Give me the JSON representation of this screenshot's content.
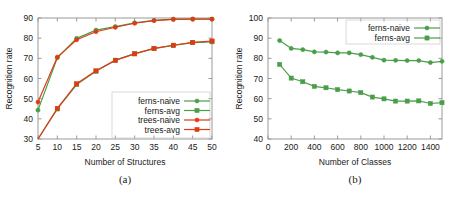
{
  "figure": {
    "panels": [
      {
        "id": "panel-a",
        "subfigure_label": "(a)",
        "xlabel": "Number of Structures",
        "ylabel": "Recognition rate"
      },
      {
        "id": "panel-b",
        "subfigure_label": "(b)",
        "xlabel": "Number of Classes",
        "ylabel": "Recognition rate"
      }
    ]
  },
  "colors": {
    "ferns": "#4a9e4a",
    "trees": "#e03a14",
    "axis": "#9a9a9a",
    "text": "#1a1a1a",
    "background": "#ffffff"
  },
  "chart_data": [
    {
      "type": "line",
      "id": "panel-a",
      "title": "",
      "xlabel": "Number of Structures",
      "ylabel": "Recognition rate",
      "xlim": [
        5,
        50
      ],
      "ylim": [
        30,
        90
      ],
      "xticks": [
        5,
        10,
        15,
        20,
        25,
        30,
        35,
        40,
        45,
        50
      ],
      "yticks": [
        30,
        40,
        50,
        60,
        70,
        80,
        90
      ],
      "grid": false,
      "legend_position": "lower-right",
      "x": [
        5,
        10,
        15,
        20,
        25,
        30,
        35,
        40,
        45,
        50
      ],
      "series": [
        {
          "name": "ferns-naive",
          "color": "#4a9e4a",
          "marker": "circle",
          "values": [
            44.3,
            70.3,
            79.9,
            84.0,
            85.7,
            87.6,
            88.8,
            89.4,
            89.5,
            89.5
          ]
        },
        {
          "name": "ferns-avg",
          "color": "#4a9e4a",
          "marker": "square",
          "values": [
            30.0,
            44.9,
            57.0,
            63.6,
            69.1,
            72.3,
            74.8,
            76.4,
            77.8,
            78.2
          ]
        },
        {
          "name": "trees-naive",
          "color": "#e03a14",
          "marker": "circle",
          "values": [
            48.3,
            70.6,
            79.2,
            83.2,
            85.4,
            87.4,
            88.7,
            89.3,
            89.4,
            89.4
          ]
        },
        {
          "name": "trees-avg",
          "color": "#e03a14",
          "marker": "square",
          "values": [
            30.0,
            45.2,
            57.4,
            63.8,
            69.0,
            72.2,
            74.9,
            76.5,
            77.9,
            78.6
          ]
        }
      ]
    },
    {
      "type": "line",
      "id": "panel-b",
      "title": "",
      "xlabel": "Number of Classes",
      "ylabel": "Recognition rate",
      "xlim": [
        0,
        1500
      ],
      "ylim": [
        40,
        100
      ],
      "xticks": [
        0,
        200,
        400,
        600,
        800,
        1000,
        1200,
        1400
      ],
      "yticks": [
        40,
        50,
        60,
        70,
        80,
        90,
        100
      ],
      "grid": false,
      "legend_position": "upper-right",
      "x": [
        100,
        200,
        300,
        400,
        500,
        600,
        700,
        800,
        900,
        1000,
        1100,
        1200,
        1300,
        1400,
        1500
      ],
      "series": [
        {
          "name": "ferns-naive",
          "color": "#4a9e4a",
          "marker": "circle",
          "values": [
            88.8,
            84.9,
            84.3,
            83.2,
            83.1,
            82.7,
            82.7,
            81.8,
            80.5,
            79.1,
            79.0,
            78.9,
            78.9,
            77.9,
            78.5
          ]
        },
        {
          "name": "ferns-avg",
          "color": "#4a9e4a",
          "marker": "square",
          "values": [
            77.0,
            70.2,
            68.4,
            66.1,
            65.4,
            64.5,
            63.8,
            63.0,
            60.8,
            59.9,
            58.8,
            58.8,
            58.9,
            57.6,
            58.0
          ]
        }
      ]
    }
  ]
}
